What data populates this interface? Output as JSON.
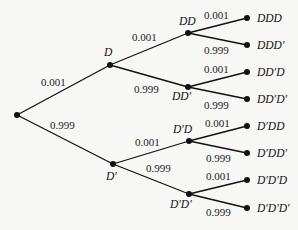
{
  "diagram": {
    "type": "probability-tree",
    "levels": 3,
    "nodes": {
      "root": {
        "label": "",
        "x": 17,
        "y": 115
      },
      "D": {
        "label": "D",
        "x": 110,
        "y": 65
      },
      "Dp": {
        "label": "D′",
        "x": 113,
        "y": 164
      },
      "DD": {
        "label": "DD",
        "x": 188,
        "y": 33
      },
      "DDp": {
        "label": "DD′",
        "x": 188,
        "y": 87
      },
      "DpD": {
        "label": "D′D",
        "x": 189,
        "y": 141
      },
      "DpDp": {
        "label": "D′D′",
        "x": 189,
        "y": 194
      },
      "DDD": {
        "label": "DDD",
        "x": 247,
        "y": 18
      },
      "DDDp": {
        "label": "DDD′",
        "x": 247,
        "y": 45
      },
      "DDpD": {
        "label": "DD′D",
        "x": 247,
        "y": 72
      },
      "DDpDp": {
        "label": "DD′D′",
        "x": 247,
        "y": 99
      },
      "DpDD": {
        "label": "D′DD",
        "x": 247,
        "y": 126
      },
      "DpDDp": {
        "label": "D′DD′",
        "x": 247,
        "y": 153
      },
      "DpDpD": {
        "label": "D′D′D",
        "x": 247,
        "y": 180
      },
      "DpDpDp": {
        "label": "D′D′D′",
        "x": 247,
        "y": 208
      }
    },
    "edges": [
      {
        "from": "root",
        "to": "D",
        "prob": "0.001"
      },
      {
        "from": "root",
        "to": "Dp",
        "prob": "0.999"
      },
      {
        "from": "D",
        "to": "DD",
        "prob": "0.001"
      },
      {
        "from": "D",
        "to": "DDp",
        "prob": "0.999"
      },
      {
        "from": "Dp",
        "to": "DpD",
        "prob": "0.001"
      },
      {
        "from": "Dp",
        "to": "DpDp",
        "prob": "0.999"
      },
      {
        "from": "DD",
        "to": "DDD",
        "prob": "0.001"
      },
      {
        "from": "DD",
        "to": "DDDp",
        "prob": "0.999"
      },
      {
        "from": "DDp",
        "to": "DDpD",
        "prob": "0.001"
      },
      {
        "from": "DDp",
        "to": "DDpDp",
        "prob": "0.999"
      },
      {
        "from": "DpD",
        "to": "DpDD",
        "prob": "0.001"
      },
      {
        "from": "DpD",
        "to": "DpDDp",
        "prob": "0.999"
      },
      {
        "from": "DpDp",
        "to": "DpDpD",
        "prob": "0.001"
      },
      {
        "from": "DpDp",
        "to": "DpDpDp",
        "prob": "0.999"
      }
    ],
    "colors": {
      "background": "#f7f7f5",
      "line": "#111111",
      "text": "#222222"
    }
  }
}
